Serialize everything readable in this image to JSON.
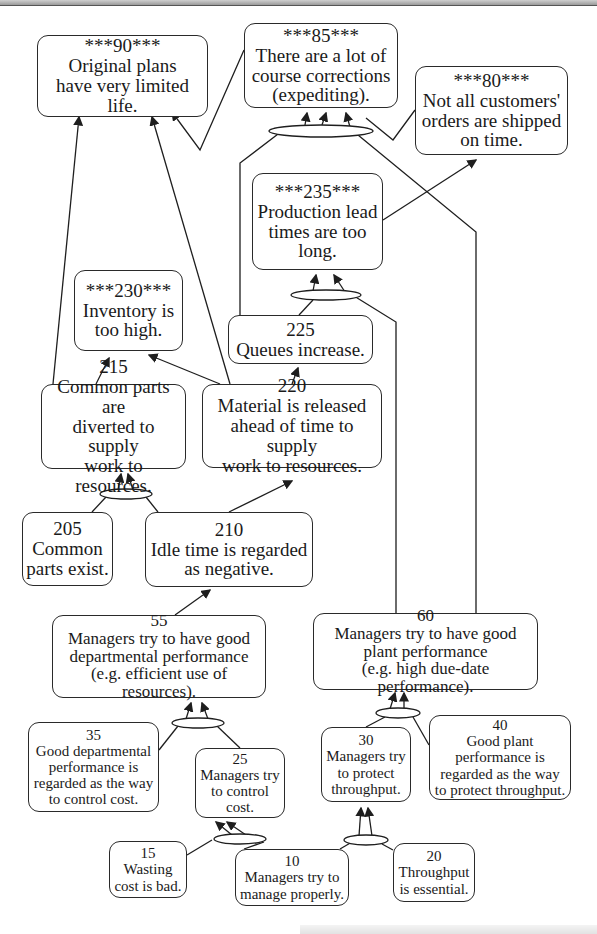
{
  "diagram": {
    "type": "current-reality-tree",
    "nodes": [
      {
        "id": "n90",
        "label": "***90***",
        "text": "Original plans\nhave very limited\nlife.",
        "x": 37,
        "y": 35,
        "w": 171,
        "h": 82,
        "size": "big"
      },
      {
        "id": "n85",
        "label": "***85***",
        "text": "There are a lot of\ncourse corrections\n(expediting).",
        "x": 244,
        "y": 23,
        "w": 154,
        "h": 85,
        "size": "big"
      },
      {
        "id": "n80",
        "label": "***80***",
        "text": "Not all customers'\norders are shipped\non time.",
        "x": 415,
        "y": 66,
        "w": 153,
        "h": 89,
        "size": "big"
      },
      {
        "id": "n235",
        "label": "***235***",
        "text": "Production lead\ntimes are too\nlong.",
        "x": 252,
        "y": 173,
        "w": 131,
        "h": 97,
        "size": "big"
      },
      {
        "id": "n230",
        "label": "***230***",
        "text": "Inventory is\ntoo high.",
        "x": 74,
        "y": 270,
        "w": 109,
        "h": 81,
        "size": "big"
      },
      {
        "id": "n225",
        "label": "225",
        "text": "Queues increase.",
        "x": 228,
        "y": 315,
        "w": 145,
        "h": 49,
        "size": "big"
      },
      {
        "id": "n215",
        "label": "215",
        "text": "Common parts are\ndiverted to supply\nwork to resources.",
        "x": 41,
        "y": 384,
        "w": 145,
        "h": 85,
        "size": "big"
      },
      {
        "id": "n220",
        "label": "220",
        "text": "Material is released\nahead of time to supply\nwork to resources.",
        "x": 202,
        "y": 384,
        "w": 180,
        "h": 84,
        "size": "big"
      },
      {
        "id": "n205",
        "label": "205",
        "text": "Common\nparts exist.",
        "x": 22,
        "y": 512,
        "w": 91,
        "h": 74,
        "size": "big"
      },
      {
        "id": "n210",
        "label": "210",
        "text": "Idle time is regarded\nas negative.",
        "x": 145,
        "y": 512,
        "w": 168,
        "h": 75,
        "size": "big"
      },
      {
        "id": "n55",
        "label": "55",
        "text": "Managers try to have good\ndepartmental performance\n(e.g. efficient use of resources).",
        "x": 52,
        "y": 615,
        "w": 214,
        "h": 83,
        "size": "mid"
      },
      {
        "id": "n60",
        "label": "60",
        "text": "Managers try to have good\nplant performance\n(e.g. high due-date performance).",
        "x": 313,
        "y": 613,
        "w": 225,
        "h": 77,
        "size": "mid"
      },
      {
        "id": "n35",
        "label": "35",
        "text": "Good departmental\nperformance is\nregarded as the way\nto control cost.",
        "x": 28,
        "y": 722,
        "w": 131,
        "h": 90,
        "size": "sm"
      },
      {
        "id": "n25",
        "label": "25",
        "text": "Managers try\nto control\ncost.",
        "x": 195,
        "y": 748,
        "w": 90,
        "h": 70,
        "size": "sm"
      },
      {
        "id": "n30",
        "label": "30",
        "text": "Managers try\nto protect\nthroughput.",
        "x": 321,
        "y": 727,
        "w": 90,
        "h": 75,
        "size": "sm"
      },
      {
        "id": "n40",
        "label": "40",
        "text": "Good plant\nperformance is\nregarded as the way\nto protect throughput.",
        "x": 429,
        "y": 715,
        "w": 142,
        "h": 85,
        "size": "sm"
      },
      {
        "id": "n15",
        "label": "15",
        "text": "Wasting\ncost is bad.",
        "x": 109,
        "y": 841,
        "w": 78,
        "h": 57,
        "size": "sm"
      },
      {
        "id": "n10",
        "label": "10",
        "text": "Managers try to\nmanage properly.",
        "x": 235,
        "y": 849,
        "w": 114,
        "h": 57,
        "size": "sm"
      },
      {
        "id": "n20",
        "label": "20",
        "text": "Throughput\nis essential.",
        "x": 393,
        "y": 843,
        "w": 82,
        "h": 59,
        "size": "sm"
      }
    ],
    "and_ellipses": [
      {
        "id": "and85",
        "cx": 321,
        "cy": 131,
        "rx": 52,
        "ry": 6
      },
      {
        "id": "and235",
        "cx": 326,
        "cy": 295,
        "rx": 35,
        "ry": 5
      },
      {
        "id": "and215",
        "cx": 126,
        "cy": 494,
        "rx": 26,
        "ry": 5
      },
      {
        "id": "and55",
        "cx": 198,
        "cy": 723,
        "rx": 26,
        "ry": 5
      },
      {
        "id": "and25",
        "cx": 240,
        "cy": 839,
        "rx": 26,
        "ry": 5
      },
      {
        "id": "and60",
        "cx": 398,
        "cy": 713,
        "rx": 22,
        "ry": 5
      },
      {
        "id": "and30",
        "cx": 366,
        "cy": 840,
        "rx": 22,
        "ry": 5
      }
    ],
    "edges": [
      {
        "from": "n215",
        "to": "n90",
        "points": [
          [
            53,
            384
          ],
          [
            79,
            117
          ]
        ],
        "arrow": true
      },
      {
        "from": "n220",
        "to": "n90",
        "points": [
          [
            230,
            384
          ],
          [
            152,
            117
          ]
        ],
        "arrow": true
      },
      {
        "from": "n85",
        "to": "n90",
        "points": [
          [
            244,
            50
          ],
          [
            200,
            150
          ],
          [
            172,
            112
          ]
        ],
        "arrow": true
      },
      {
        "from": "n80",
        "to": "n85",
        "points": [
          [
            415,
            110
          ],
          [
            393,
            140
          ],
          [
            366,
            118
          ]
        ],
        "arrow": false
      },
      {
        "from": "and85",
        "to": "n85",
        "points": [
          [
            305,
            125
          ],
          [
            307,
            113
          ]
        ],
        "arrow": true
      },
      {
        "from": "and85",
        "to": "n85",
        "points": [
          [
            322,
            125
          ],
          [
            326,
            113
          ]
        ],
        "arrow": true
      },
      {
        "from": "and85",
        "to": "n85",
        "points": [
          [
            350,
            127
          ],
          [
            346,
            113
          ]
        ],
        "arrow": true
      },
      {
        "from": "n225",
        "to": "and85",
        "points": [
          [
            240,
            315
          ],
          [
            240,
            163
          ],
          [
            282,
            131
          ]
        ],
        "arrow": false
      },
      {
        "from": "n60",
        "to": "and85",
        "points": [
          [
            476,
            613
          ],
          [
            476,
            232
          ],
          [
            358,
            135
          ]
        ],
        "arrow": false
      },
      {
        "from": "n235",
        "to": "n80",
        "points": [
          [
            383,
            220
          ],
          [
            476,
            160
          ]
        ],
        "arrow": true
      },
      {
        "from": "and235",
        "to": "n235",
        "points": [
          [
            313,
            291
          ],
          [
            316,
            275
          ]
        ],
        "arrow": true
      },
      {
        "from": "and235",
        "to": "n235",
        "points": [
          [
            345,
            292
          ],
          [
            334,
            275
          ]
        ],
        "arrow": true
      },
      {
        "from": "n225",
        "to": "and235",
        "points": [
          [
            299,
            315
          ],
          [
            313,
            300
          ]
        ],
        "arrow": false
      },
      {
        "from": "n60",
        "to": "and235",
        "points": [
          [
            396,
            613
          ],
          [
            396,
            322
          ],
          [
            354,
            296
          ]
        ],
        "arrow": false
      },
      {
        "from": "n215",
        "to": "n230",
        "points": [
          [
            96,
            384
          ],
          [
            109,
            358
          ]
        ],
        "arrow": true
      },
      {
        "from": "n220",
        "to": "n230",
        "points": [
          [
            220,
            384
          ],
          [
            149,
            355
          ]
        ],
        "arrow": true
      },
      {
        "from": "n220",
        "to": "n225",
        "points": [
          [
            292,
            384
          ],
          [
            298,
            368
          ]
        ],
        "arrow": true
      },
      {
        "from": "and215",
        "to": "n215",
        "points": [
          [
            118,
            490
          ],
          [
            121,
            474
          ]
        ],
        "arrow": true
      },
      {
        "from": "and215",
        "to": "n215",
        "points": [
          [
            133,
            490
          ],
          [
            128,
            474
          ]
        ],
        "arrow": true
      },
      {
        "from": "n205",
        "to": "and215",
        "points": [
          [
            92,
            512
          ],
          [
            106,
            497
          ]
        ],
        "arrow": false
      },
      {
        "from": "n210",
        "to": "and215",
        "points": [
          [
            158,
            512
          ],
          [
            146,
            497
          ]
        ],
        "arrow": false
      },
      {
        "from": "n210",
        "to": "n220",
        "points": [
          [
            229,
            512
          ],
          [
            292,
            481
          ]
        ],
        "arrow": true
      },
      {
        "from": "n55",
        "to": "n210",
        "points": [
          [
            175,
            615
          ],
          [
            210,
            590
          ]
        ],
        "arrow": true
      },
      {
        "from": "and55",
        "to": "n55",
        "points": [
          [
            186,
            719
          ],
          [
            191,
            703
          ]
        ],
        "arrow": true
      },
      {
        "from": "and55",
        "to": "n55",
        "points": [
          [
            208,
            719
          ],
          [
            202,
            703
          ]
        ],
        "arrow": true
      },
      {
        "from": "n35",
        "to": "and55",
        "points": [
          [
            159,
            750
          ],
          [
            178,
            726
          ]
        ],
        "arrow": false
      },
      {
        "from": "n25",
        "to": "and55",
        "points": [
          [
            240,
            748
          ],
          [
            217,
            726
          ]
        ],
        "arrow": false
      },
      {
        "from": "and25",
        "to": "n25",
        "points": [
          [
            232,
            835
          ],
          [
            216,
            822
          ]
        ],
        "arrow": true
      },
      {
        "from": "and25",
        "to": "n25",
        "points": [
          [
            246,
            835
          ],
          [
            227,
            822
          ]
        ],
        "arrow": true
      },
      {
        "from": "n15",
        "to": "and25",
        "points": [
          [
            187,
            855
          ],
          [
            212,
            840
          ]
        ],
        "arrow": false
      },
      {
        "from": "n10",
        "to": "and25",
        "points": [
          [
            244,
            849
          ],
          [
            264,
            842
          ]
        ],
        "arrow": false
      },
      {
        "from": "and60",
        "to": "n60",
        "points": [
          [
            390,
            709
          ],
          [
            395,
            693
          ]
        ],
        "arrow": true
      },
      {
        "from": "and60",
        "to": "n60",
        "points": [
          [
            404,
            709
          ],
          [
            404,
            693
          ]
        ],
        "arrow": true
      },
      {
        "from": "n30",
        "to": "and60",
        "points": [
          [
            366,
            727
          ],
          [
            385,
            717
          ]
        ],
        "arrow": false
      },
      {
        "from": "n40",
        "to": "and60",
        "points": [
          [
            429,
            745
          ],
          [
            413,
            717
          ]
        ],
        "arrow": false
      },
      {
        "from": "and30",
        "to": "n30",
        "points": [
          [
            359,
            836
          ],
          [
            361,
            808
          ]
        ],
        "arrow": true
      },
      {
        "from": "and30",
        "to": "n30",
        "points": [
          [
            372,
            836
          ],
          [
            368,
            808
          ]
        ],
        "arrow": true
      },
      {
        "from": "n10",
        "to": "and30",
        "points": [
          [
            340,
            849
          ],
          [
            352,
            842
          ]
        ],
        "arrow": false
      },
      {
        "from": "n20",
        "to": "and30",
        "points": [
          [
            393,
            850
          ],
          [
            382,
            844
          ]
        ],
        "arrow": false
      }
    ]
  },
  "colors": {
    "stroke": "#1e1e1e",
    "node_bg": "#ffffff",
    "page_bg": "#ffffff"
  }
}
